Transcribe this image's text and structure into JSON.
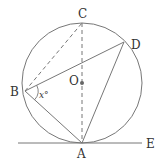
{
  "diagram": {
    "type": "circle-geometry",
    "colors": {
      "stroke": "#777777",
      "label": "#333333",
      "center_dot": "#666666"
    },
    "circle": {
      "center": "O",
      "cx": 82,
      "cy": 83,
      "r": 60
    },
    "points": {
      "A": {
        "label": "A",
        "x": 82,
        "y": 143
      },
      "B": {
        "label": "B",
        "x": 25,
        "y": 91
      },
      "C": {
        "label": "C",
        "x": 82,
        "y": 23
      },
      "D": {
        "label": "D",
        "x": 124,
        "y": 42
      },
      "O": {
        "label": "O",
        "x": 82,
        "y": 83
      },
      "E": {
        "label": "E",
        "x": 142,
        "y": 143
      }
    },
    "segments": [
      {
        "from": "B",
        "to": "D",
        "style": "solid"
      },
      {
        "from": "B",
        "to": "A",
        "style": "solid"
      },
      {
        "from": "D",
        "to": "A",
        "style": "solid"
      },
      {
        "from": "B",
        "to": "C",
        "style": "dashed"
      },
      {
        "from": "C",
        "to": "A",
        "style": "dashed"
      }
    ],
    "tangent_line": {
      "label": "E",
      "through": "A"
    },
    "angle": {
      "vertex": "B",
      "label": "x°"
    }
  }
}
